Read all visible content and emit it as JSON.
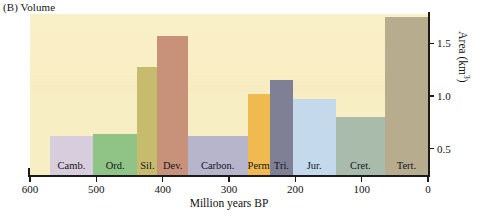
{
  "panel": {
    "label": "(B) Volume"
  },
  "axes": {
    "x": {
      "title": "Million years BP",
      "ticks": [
        600,
        500,
        400,
        300,
        200,
        100,
        0
      ],
      "tick_labels": [
        "600",
        "500",
        "400",
        "300",
        "200",
        "100",
        "0"
      ],
      "min": 0,
      "max": 600,
      "reversed": true
    },
    "y": {
      "title_text": "Area (km",
      "title_sup": "3",
      "title_tail": ")",
      "ticks": [
        0.5,
        1.0,
        1.5
      ],
      "tick_labels": [
        "0.5",
        "1.0",
        "1.5"
      ],
      "min": 0.25,
      "max": 1.78
    }
  },
  "chart_data": {
    "type": "bar",
    "title": "(B) Volume",
    "xlabel": "Million years BP",
    "ylabel": "Area (km3)",
    "xlim": [
      600,
      0
    ],
    "ylim": [
      0.25,
      1.78
    ],
    "grid": false,
    "legend": "none",
    "note": "Horizontal bar widths span each geological period along the time axis (Million years BP, decreasing left to right).",
    "categories": [
      "Camb.",
      "Ord.",
      "Sil.",
      "Dev.",
      "Carbon.",
      "Perm.",
      "Tri.",
      "Jur.",
      "Cret.",
      "Tert."
    ],
    "values": [
      0.62,
      0.64,
      1.28,
      1.57,
      0.62,
      1.02,
      1.15,
      0.97,
      0.8,
      1.75
    ],
    "bars": [
      {
        "label": "Camb.",
        "x_start": 570,
        "x_end": 505,
        "value": 0.62,
        "color": "#d8cddc"
      },
      {
        "label": "Ord.",
        "x_start": 505,
        "x_end": 438,
        "value": 0.64,
        "color": "#8fc486"
      },
      {
        "label": "Sil.",
        "x_start": 438,
        "x_end": 408,
        "value": 1.28,
        "color": "#c7bb6e"
      },
      {
        "label": "Dev.",
        "x_start": 408,
        "x_end": 362,
        "value": 1.57,
        "color": "#c79279"
      },
      {
        "label": "Carbon.",
        "x_start": 362,
        "x_end": 272,
        "value": 0.62,
        "color": "#b6b5cb"
      },
      {
        "label": "Perm.",
        "x_start": 272,
        "x_end": 238,
        "value": 1.02,
        "color": "#f0ba51"
      },
      {
        "label": "Tri.",
        "x_start": 238,
        "x_end": 204,
        "value": 1.15,
        "color": "#7f7f95"
      },
      {
        "label": "Jur.",
        "x_start": 204,
        "x_end": 139,
        "value": 0.97,
        "color": "#c4d9eb"
      },
      {
        "label": "Cret.",
        "x_start": 139,
        "x_end": 65,
        "value": 0.8,
        "color": "#a9bcab"
      },
      {
        "label": "Tert.",
        "x_start": 65,
        "x_end": 0,
        "value": 1.75,
        "color": "#b7ac8e"
      }
    ]
  },
  "colors": {
    "plot_background": "#f8eec3",
    "axis": "#1a1a1a",
    "text": "#111111"
  }
}
